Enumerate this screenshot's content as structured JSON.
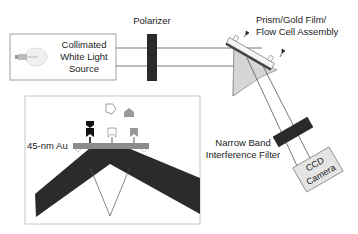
{
  "diagram": {
    "type": "SPR imaging optical setup",
    "labels": {
      "light_source_line1": "Collimated",
      "light_source_line2": "White Light",
      "light_source_line3": "Source",
      "polarizer": "Polarizer",
      "prism_line1": "Prism/Gold Film/",
      "prism_line2": "Flow Cell Assembly",
      "filter_line1": "Narrow Band",
      "filter_line2": "Interference Filter",
      "camera_line1": "CCD",
      "camera_line2": "Camera",
      "gold_film": "45-nm Au"
    },
    "icons": [
      "light-bulb-icon",
      "polarizer-plate",
      "prism",
      "flow-cell",
      "interference-filter",
      "ccd-camera",
      "antibody-receptor-black",
      "antibody-receptor-white",
      "antibody-receptor-gray",
      "antigen-white",
      "antigen-gray",
      "antigen-bound-black"
    ],
    "colors": {
      "dark": "#2a2a2a",
      "prism_fill": "#d4d4d4",
      "gold_film": "#8c8c8c",
      "camera_fill": "#e2e2e2",
      "line": "#555555",
      "box_border": "#bbbbbb"
    }
  }
}
